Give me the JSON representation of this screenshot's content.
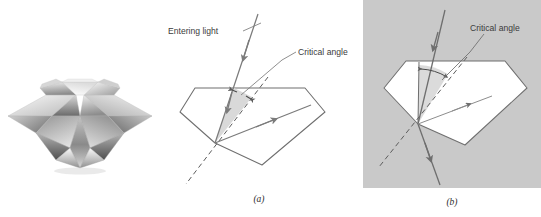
{
  "figure": {
    "panels": [
      {
        "id": "photo",
        "label": ""
      },
      {
        "id": "a",
        "label": "(a)"
      },
      {
        "id": "b",
        "label": "(b)"
      }
    ]
  },
  "panel_a": {
    "label": "(a)",
    "entering_light_label": "Entering light",
    "critical_angle_label": "Critical angle",
    "background": "#ffffff",
    "gem_fill": "#ffffff",
    "gem_stroke": "#6f6f6f",
    "ray_color": "#7b7b7b",
    "wedge_fill": "#d9d9d9",
    "normal_style": "dashed"
  },
  "panel_b": {
    "label": "(b)",
    "critical_angle_label": "Critical angle",
    "background": "#c9c9c9",
    "gem_fill": "#ffffff",
    "gem_stroke": "#6f6f6f",
    "ray_color": "#6e6e6e",
    "normal_style": "dashed"
  },
  "photo": {
    "alt_name": "cut-diamond-photograph",
    "palette": [
      "#ffffff",
      "#e8e8e8",
      "#bdbdbd",
      "#8f8f8f",
      "#636363",
      "#3d3d3d"
    ]
  },
  "colors": {
    "line": "#6f6f6f",
    "text": "#3b3b3b",
    "panel_b_bg": "#c9c9c9",
    "wedge": "#d9d9d9"
  }
}
